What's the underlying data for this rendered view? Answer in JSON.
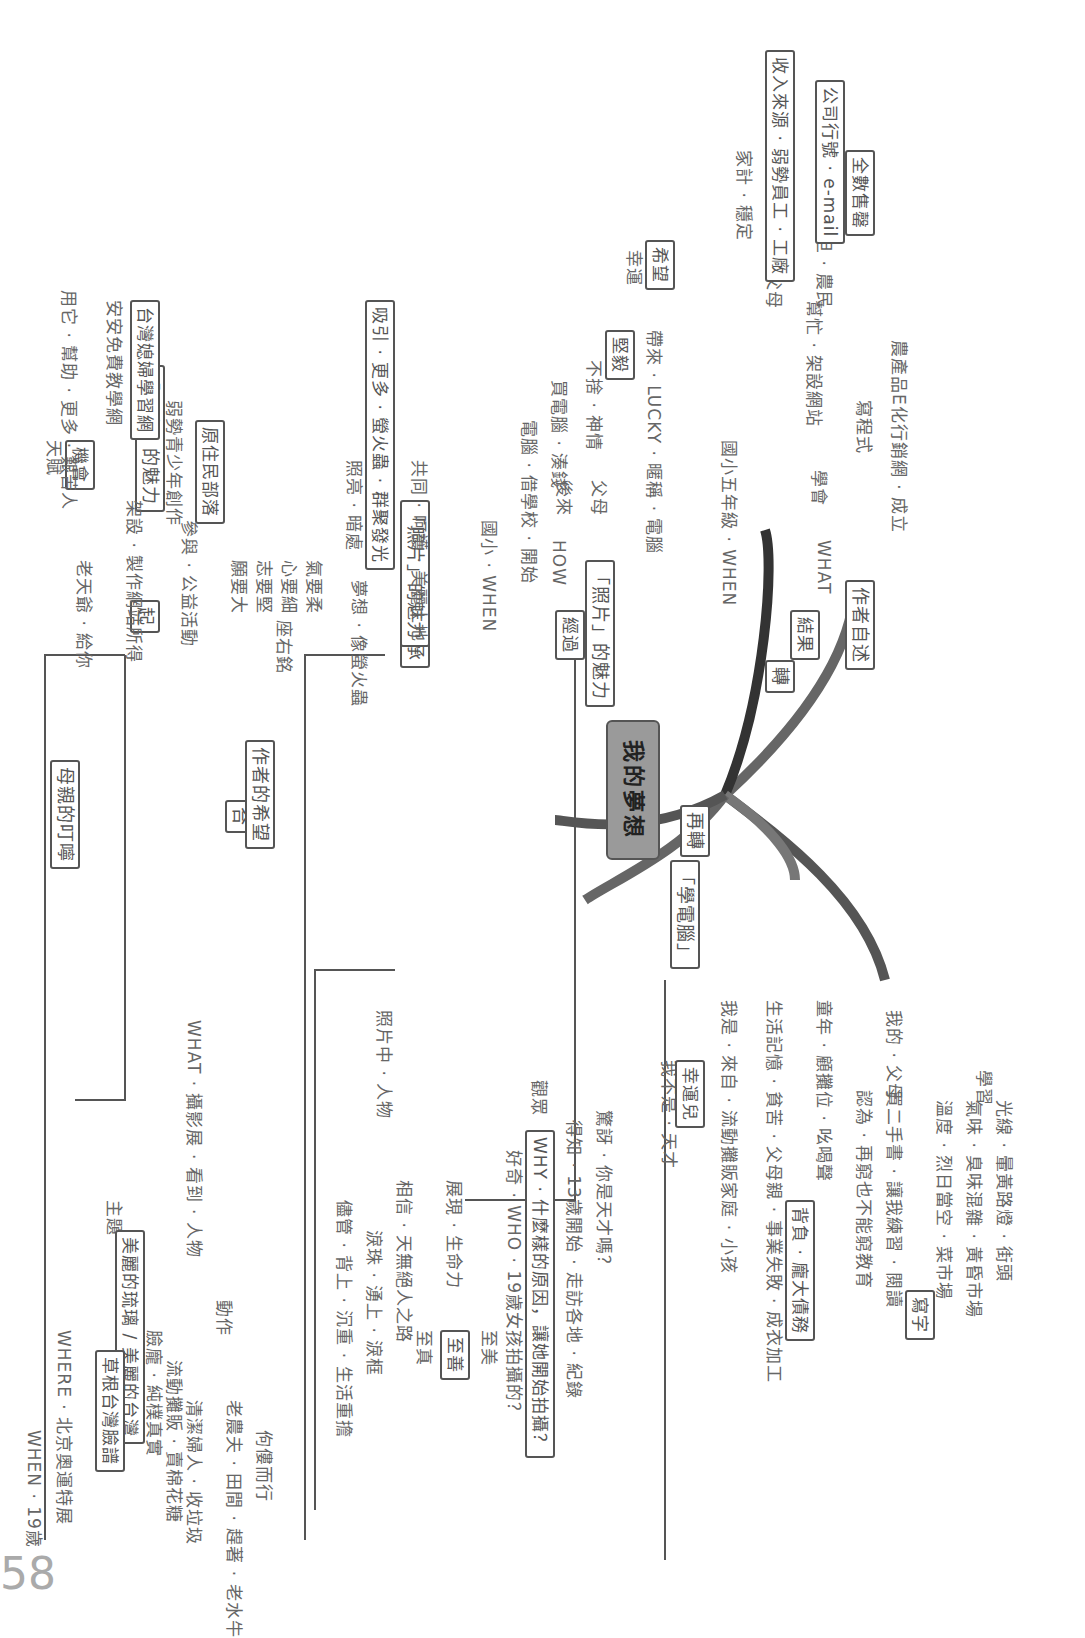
{
  "page_number": "58",
  "root": {
    "label": "我的夢想"
  },
  "branches": {
    "qi": {
      "label": "起",
      "child": "「照片」的魅力",
      "items": [
        {
          "text": "WHEN · 19歲"
        },
        {
          "text": "WHERE · 北京奧運特展"
        },
        {
          "text": "WHAT · 攝影展 · 看到 · 人物"
        },
        {
          "text": "主題"
        },
        {
          "text": "美麗的琉璃 / 美麗的台灣"
        },
        {
          "text": "草根台灣臉譜"
        },
        {
          "text": "動作"
        },
        {
          "text": "臉龐 · 純樸真實"
        },
        {
          "text": "流動攤販 · 賣棉花糖"
        },
        {
          "text": "清潔婦人 · 收垃圾"
        },
        {
          "text": "老農夫 · 田間 · 趕著 · 老水牛"
        },
        {
          "text": "佝僂而行"
        }
      ]
    },
    "cheng": {
      "label": "承",
      "child": "「照片」的魅力",
      "path": "照片中 · 人物",
      "items": [
        {
          "text": "儘管 · 背上 · 沉重 · 生活重擔"
        },
        {
          "text": "淚珠 · 湧上 · 淚框"
        },
        {
          "text": "相信 · 天無絕人之路"
        },
        {
          "text": "展現 · 生命力"
        },
        {
          "text": "至真"
        },
        {
          "text": "至善"
        },
        {
          "text": "至美"
        }
      ]
    },
    "zhuan": {
      "label": "轉",
      "children": [
        "「照片」的魅力",
        "作者自述"
      ],
      "audience": {
        "label": "觀眾",
        "items": [
          {
            "text": "好奇 · WHO · 19歲女孩拍攝的？"
          },
          {
            "text": "WHY · 什麼樣的原因，讓她開始拍攝？"
          },
          {
            "text": "得知 · 13歲開始 · 走訪各地 · 紀錄"
          },
          {
            "text": "驚訝 · 你是天才嗎？"
          }
        ]
      },
      "author": {
        "items": [
          {
            "text": "我不是 · 天才"
          },
          {
            "text": "幸運兒"
          },
          {
            "text": "我是 · 來自 · 流動攤販家庭 · 小孩"
          },
          {
            "text": "生活記憶 · 貧苦 · 父母親 · 事業失敗 · 成衣加工"
          },
          {
            "text": "背負 · 龐大債務"
          },
          {
            "text": "童年 · 顧攤位 · 吆喝聲"
          },
          {
            "text": "我的 · 父母"
          },
          {
            "text": "認為 · 再窮也不能窮教育"
          },
          {
            "text": "買二手書 · 讓我練習 · 閱讀"
          },
          {
            "text": "寫字"
          },
          {
            "text": "學習"
          },
          {
            "text": "溫度 · 烈日當空 · 菜市場"
          },
          {
            "text": "氣味 · 臭味混雜 · 黃昏市場"
          },
          {
            "text": "光線 · 暈黃路燈 · 街頭"
          }
        ]
      }
    },
    "zaizhuan": {
      "label": "再轉",
      "child": "「學電腦」",
      "process": {
        "label": "經過",
        "items": [
          {
            "text": "國小 · WHEN"
          },
          {
            "text": "HOW"
          },
          {
            "text": "電腦 · 借學校 · 開始"
          },
          {
            "text": "後來"
          },
          {
            "text": "買電腦 · 湊錢"
          },
          {
            "text": "父母"
          },
          {
            "text": "不捨 · 神情"
          },
          {
            "text": "堅毅"
          },
          {
            "text": "帶來 · LUCKY · 暱稱 · 電腦"
          },
          {
            "text": "幸運"
          },
          {
            "text": "希望"
          }
        ]
      },
      "result": {
        "label": "結果",
        "items": [
          {
            "text": "國小五年級 · WHEN"
          },
          {
            "text": "WHAT"
          },
          {
            "text": "學會"
          },
          {
            "text": "寫程式"
          },
          {
            "text": "農產品E化行銷網 · 成立"
          },
          {
            "text": "幫忙 · 架設網站"
          },
          {
            "text": "賣衣服 · 父母"
          },
          {
            "text": "家計 · 穩定"
          },
          {
            "text": "收入來源 · 弱勢員工 · 工廠"
          },
          {
            "text": "賣文旦 · 農民"
          },
          {
            "text": "公司行號 · e-mail"
          },
          {
            "text": "全數售罄"
          }
        ]
      }
    },
    "he": {
      "label": "合",
      "mother": {
        "label": "母親的叮嚀",
        "items": [
          {
            "text": "老天爺 · 給你"
          },
          {
            "text": "天賦"
          },
          {
            "text": "機會"
          },
          {
            "text": "用它 · 幫助 · 更多 · 艱苦人"
          }
        ]
      },
      "author_hope": {
        "label": "作者的希望",
        "items": [
          {
            "text": "架設 · 製作網站所得"
          },
          {
            "text": "安安免費教學網"
          },
          {
            "text": "台灣媳婦學習網"
          },
          {
            "text": "參與 · 公益活動"
          },
          {
            "text": "弱勢青少年創作"
          },
          {
            "text": "原住民部落"
          },
          {
            "text": "座右銘"
          },
          {
            "text": "願要大"
          },
          {
            "text": "志要堅"
          },
          {
            "text": "心要細"
          },
          {
            "text": "氣要柔"
          },
          {
            "text": "夢想 · 像螢火蟲"
          },
          {
            "text": "照亮 · 暗處"
          },
          {
            "text": "吸引 · 更多 · 螢火蟲 · 群聚發光"
          },
          {
            "text": "共同 · 呵護 · 美麗土地"
          }
        ]
      }
    }
  }
}
